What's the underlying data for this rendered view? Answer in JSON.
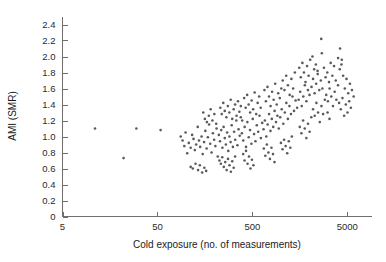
{
  "chart_data": {
    "type": "scatter",
    "title": "",
    "xlabel": "Cold exposure (no. of measurements)",
    "ylabel": "AMI (SMR)",
    "xscale": "log",
    "yscale": "linear",
    "xlim": [
      5,
      9000
    ],
    "ylim": [
      0,
      2.5
    ],
    "xticks": [
      5,
      50,
      500,
      5000
    ],
    "xtick_labels": [
      "5",
      "50",
      "500",
      "5000"
    ],
    "yticks": [
      0,
      0.2,
      0.4,
      0.6,
      0.8,
      1.0,
      1.2,
      1.4,
      1.6,
      1.8,
      2.0,
      2.2,
      2.4
    ],
    "ytick_labels": [
      "0",
      "0.2",
      "0.4",
      "0.6",
      "0.8",
      "1.0",
      "1.2",
      "1.4",
      "1.6",
      "1.8",
      "2.0",
      "2.2",
      "2.4"
    ],
    "grid": false,
    "legend": null,
    "marker": "point",
    "marker_color": "#5a5a5a",
    "marker_size": 1.3,
    "n_points": 224,
    "points": [
      [
        11,
        1.1
      ],
      [
        30,
        1.1
      ],
      [
        22,
        0.73
      ],
      [
        54,
        1.08
      ],
      [
        88,
        1.0
      ],
      [
        92,
        0.95
      ],
      [
        96,
        0.88
      ],
      [
        99,
        1.05
      ],
      [
        103,
        0.79
      ],
      [
        107,
        0.92
      ],
      [
        112,
        0.86
      ],
      [
        116,
        1.02
      ],
      [
        120,
        0.97
      ],
      [
        124,
        0.83
      ],
      [
        128,
        0.9
      ],
      [
        133,
        1.12
      ],
      [
        137,
        0.95
      ],
      [
        141,
        0.87
      ],
      [
        146,
        1.0
      ],
      [
        150,
        0.78
      ],
      [
        155,
        0.93
      ],
      [
        160,
        1.07
      ],
      [
        165,
        0.85
      ],
      [
        170,
        0.99
      ],
      [
        175,
        1.15
      ],
      [
        180,
        0.91
      ],
      [
        186,
        0.8
      ],
      [
        192,
        1.04
      ],
      [
        198,
        0.96
      ],
      [
        204,
        0.88
      ],
      [
        210,
        1.1
      ],
      [
        216,
        0.75
      ],
      [
        112,
        0.62
      ],
      [
        118,
        0.6
      ],
      [
        126,
        0.66
      ],
      [
        134,
        0.58
      ],
      [
        140,
        0.64
      ],
      [
        148,
        0.55
      ],
      [
        156,
        0.61
      ],
      [
        163,
        0.57
      ],
      [
        152,
        1.3
      ],
      [
        158,
        1.22
      ],
      [
        166,
        1.18
      ],
      [
        174,
        1.26
      ],
      [
        182,
        1.34
      ],
      [
        190,
        1.2
      ],
      [
        199,
        1.28
      ],
      [
        208,
        1.16
      ],
      [
        222,
        1.02
      ],
      [
        228,
        0.94
      ],
      [
        235,
        1.08
      ],
      [
        242,
        0.86
      ],
      [
        249,
        1.12
      ],
      [
        256,
        0.98
      ],
      [
        263,
        0.9
      ],
      [
        271,
        1.05
      ],
      [
        279,
        0.82
      ],
      [
        287,
        1.0
      ],
      [
        295,
        0.93
      ],
      [
        303,
        1.14
      ],
      [
        312,
        0.87
      ],
      [
        321,
        1.06
      ],
      [
        330,
        0.96
      ],
      [
        339,
        1.2
      ],
      [
        348,
        0.89
      ],
      [
        358,
        1.09
      ],
      [
        368,
        1.01
      ],
      [
        378,
        1.24
      ],
      [
        225,
        0.7
      ],
      [
        233,
        0.66
      ],
      [
        241,
        0.74
      ],
      [
        250,
        0.62
      ],
      [
        259,
        0.68
      ],
      [
        268,
        0.58
      ],
      [
        277,
        0.72
      ],
      [
        287,
        0.64
      ],
      [
        297,
        0.56
      ],
      [
        307,
        0.69
      ],
      [
        318,
        0.61
      ],
      [
        329,
        0.75
      ],
      [
        230,
        1.36
      ],
      [
        238,
        1.28
      ],
      [
        247,
        1.42
      ],
      [
        256,
        1.32
      ],
      [
        266,
        1.24
      ],
      [
        276,
        1.38
      ],
      [
        286,
        1.3
      ],
      [
        296,
        1.46
      ],
      [
        307,
        1.22
      ],
      [
        318,
        1.34
      ],
      [
        329,
        1.4
      ],
      [
        341,
        1.26
      ],
      [
        353,
        1.44
      ],
      [
        365,
        1.31
      ],
      [
        378,
        1.38
      ],
      [
        391,
        1.2
      ],
      [
        388,
        1.04
      ],
      [
        401,
        0.95
      ],
      [
        415,
        1.12
      ],
      [
        429,
        0.87
      ],
      [
        443,
        1.18
      ],
      [
        458,
        0.99
      ],
      [
        473,
        1.08
      ],
      [
        489,
        0.91
      ],
      [
        505,
        1.22
      ],
      [
        522,
        1.03
      ],
      [
        539,
        0.94
      ],
      [
        557,
        1.14
      ],
      [
        576,
        1.06
      ],
      [
        595,
        1.26
      ],
      [
        615,
        0.98
      ],
      [
        635,
        1.17
      ],
      [
        400,
        0.78
      ],
      [
        414,
        0.7
      ],
      [
        429,
        0.82
      ],
      [
        445,
        0.66
      ],
      [
        461,
        0.75
      ],
      [
        478,
        0.6
      ],
      [
        495,
        0.71
      ],
      [
        513,
        0.64
      ],
      [
        410,
        1.48
      ],
      [
        425,
        1.36
      ],
      [
        441,
        1.52
      ],
      [
        457,
        1.4
      ],
      [
        474,
        1.3
      ],
      [
        492,
        1.45
      ],
      [
        510,
        1.34
      ],
      [
        529,
        1.55
      ],
      [
        549,
        1.28
      ],
      [
        569,
        1.42
      ],
      [
        590,
        1.5
      ],
      [
        612,
        1.36
      ],
      [
        656,
        1.09
      ],
      [
        678,
        1.2
      ],
      [
        701,
        1.0
      ],
      [
        725,
        1.15
      ],
      [
        750,
        1.28
      ],
      [
        776,
        1.07
      ],
      [
        802,
        1.22
      ],
      [
        830,
        1.12
      ],
      [
        858,
        1.32
      ],
      [
        888,
        1.18
      ],
      [
        918,
        1.26
      ],
      [
        950,
        1.1
      ],
      [
        660,
        0.85
      ],
      [
        685,
        0.76
      ],
      [
        711,
        0.9
      ],
      [
        738,
        0.8
      ],
      [
        766,
        0.72
      ],
      [
        795,
        0.86
      ],
      [
        825,
        0.78
      ],
      [
        856,
        0.68
      ],
      [
        670,
        1.58
      ],
      [
        695,
        1.44
      ],
      [
        722,
        1.62
      ],
      [
        749,
        1.5
      ],
      [
        778,
        1.38
      ],
      [
        807,
        1.56
      ],
      [
        838,
        1.46
      ],
      [
        870,
        1.66
      ],
      [
        903,
        1.4
      ],
      [
        937,
        1.54
      ],
      [
        973,
        1.48
      ],
      [
        1010,
        1.6
      ],
      [
        983,
        1.24
      ],
      [
        1020,
        1.34
      ],
      [
        1059,
        1.16
      ],
      [
        1099,
        1.3
      ],
      [
        1141,
        1.42
      ],
      [
        1184,
        1.22
      ],
      [
        1229,
        1.38
      ],
      [
        1276,
        1.28
      ],
      [
        1324,
        1.5
      ],
      [
        1374,
        1.32
      ],
      [
        1427,
        1.45
      ],
      [
        1481,
        1.36
      ],
      [
        1000,
        0.92
      ],
      [
        1040,
        0.84
      ],
      [
        1080,
        0.96
      ],
      [
        1122,
        0.88
      ],
      [
        1165,
        0.79
      ],
      [
        1210,
        0.94
      ],
      [
        1256,
        0.86
      ],
      [
        1304,
        1.0
      ],
      [
        1045,
        1.7
      ],
      [
        1090,
        1.58
      ],
      [
        1136,
        1.76
      ],
      [
        1185,
        1.64
      ],
      [
        1236,
        1.52
      ],
      [
        1289,
        1.72
      ],
      [
        1344,
        1.6
      ],
      [
        1402,
        1.8
      ],
      [
        1537,
        1.46
      ],
      [
        1596,
        1.56
      ],
      [
        1657,
        1.38
      ],
      [
        1720,
        1.5
      ],
      [
        1786,
        1.64
      ],
      [
        1855,
        1.44
      ],
      [
        1926,
        1.58
      ],
      [
        2000,
        1.52
      ],
      [
        1560,
        1.86
      ],
      [
        1620,
        1.74
      ],
      [
        1683,
        1.92
      ],
      [
        1748,
        1.8
      ],
      [
        1815,
        1.68
      ],
      [
        1885,
        1.88
      ],
      [
        1958,
        1.76
      ],
      [
        2034,
        1.96
      ],
      [
        1580,
        1.12
      ],
      [
        1645,
        1.04
      ],
      [
        1712,
        1.2
      ],
      [
        1782,
        1.1
      ],
      [
        1854,
        0.98
      ],
      [
        1929,
        1.16
      ],
      [
        2008,
        1.06
      ],
      [
        2090,
        1.24
      ],
      [
        2100,
        1.62
      ],
      [
        2180,
        1.72
      ],
      [
        2264,
        1.54
      ],
      [
        2351,
        1.66
      ],
      [
        2441,
        1.78
      ],
      [
        2535,
        1.58
      ],
      [
        2632,
        1.7
      ],
      [
        2733,
        1.6
      ],
      [
        2150,
        2.0
      ],
      [
        2240,
        1.84
      ],
      [
        2334,
        1.9
      ],
      [
        2432,
        1.82
      ],
      [
        2180,
        1.34
      ],
      [
        2270,
        1.26
      ],
      [
        2365,
        1.42
      ],
      [
        2463,
        1.3
      ],
      [
        2566,
        1.18
      ],
      [
        2673,
        1.38
      ],
      [
        2784,
        1.28
      ],
      [
        2900,
        1.46
      ],
      [
        2838,
        1.86
      ],
      [
        2957,
        1.74
      ],
      [
        3080,
        1.8
      ],
      [
        3209,
        1.68
      ],
      [
        3343,
        1.92
      ],
      [
        3482,
        1.76
      ],
      [
        3628,
        1.88
      ],
      [
        3780,
        1.7
      ],
      [
        3000,
        1.52
      ],
      [
        3126,
        1.44
      ],
      [
        3257,
        1.6
      ],
      [
        3393,
        1.5
      ],
      [
        3536,
        1.38
      ],
      [
        3684,
        1.56
      ],
      [
        3838,
        1.46
      ],
      [
        3999,
        1.64
      ],
      [
        2660,
        2.22
      ],
      [
        2700,
        2.04
      ],
      [
        3100,
        1.3
      ],
      [
        3250,
        1.22
      ],
      [
        4000,
        1.98
      ],
      [
        4167,
        1.84
      ],
      [
        4341,
        1.9
      ],
      [
        4523,
        1.76
      ],
      [
        4712,
        1.6
      ],
      [
        4909,
        1.72
      ],
      [
        5114,
        1.54
      ],
      [
        5327,
        1.66
      ],
      [
        4100,
        1.42
      ],
      [
        4271,
        1.34
      ],
      [
        4449,
        1.48
      ],
      [
        4635,
        1.26
      ],
      [
        4828,
        1.4
      ],
      [
        5029,
        1.3
      ],
      [
        5239,
        1.44
      ],
      [
        5457,
        1.36
      ],
      [
        4200,
        2.1
      ],
      [
        4380,
        1.96
      ],
      [
        5600,
        1.58
      ],
      [
        5840,
        1.5
      ]
    ]
  }
}
